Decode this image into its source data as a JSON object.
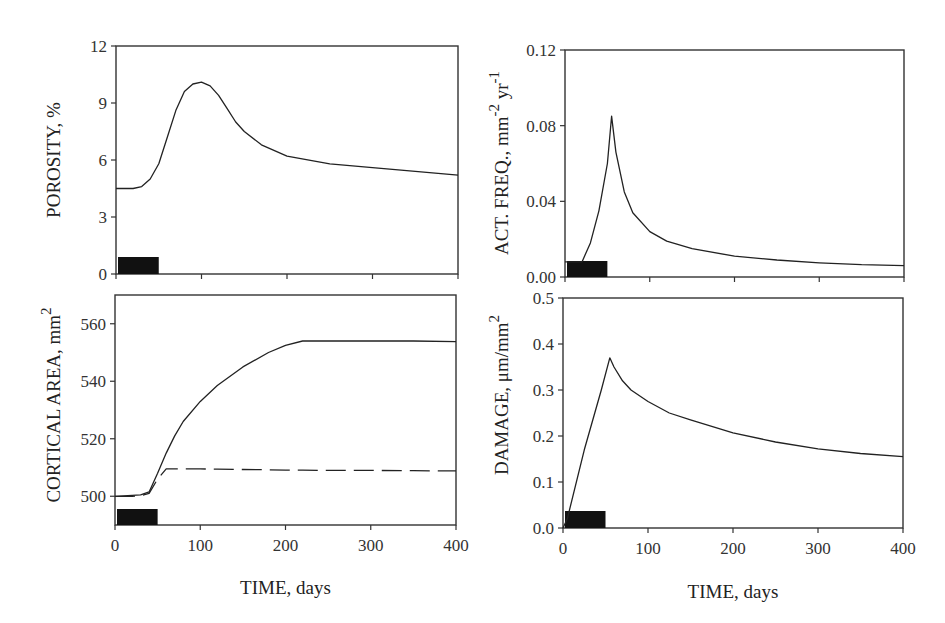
{
  "chart_data": [
    {
      "id": "porosity",
      "type": "line",
      "ylabel": "POROSITY, %",
      "xlabel": "",
      "xlim": [
        0,
        400
      ],
      "ylim": [
        0,
        12
      ],
      "yticks": [
        "0",
        "3",
        "6",
        "9",
        "12"
      ],
      "xticks": [
        0,
        100,
        200,
        300,
        400
      ],
      "x": [
        0,
        10,
        20,
        30,
        40,
        50,
        60,
        70,
        80,
        90,
        100,
        110,
        120,
        130,
        140,
        150,
        170,
        200,
        250,
        300,
        350,
        400
      ],
      "series": [
        {
          "name": "porosity",
          "style": "solid",
          "values": [
            4.5,
            4.5,
            4.5,
            4.6,
            5.0,
            5.8,
            7.2,
            8.6,
            9.6,
            10.0,
            10.1,
            9.9,
            9.4,
            8.7,
            8.0,
            7.5,
            6.8,
            6.2,
            5.8,
            5.6,
            5.4,
            5.2
          ]
        }
      ],
      "loading_bar": {
        "x_start": 0,
        "x_end": 50,
        "label": "loading period"
      },
      "grid": false
    },
    {
      "id": "activation_frequency",
      "type": "line",
      "ylabel": "ACT. FREQ., mm",
      "ylabel_sup1": "-2",
      "ylabel_mid": " yr",
      "ylabel_sup2": "-1",
      "xlabel": "",
      "xlim": [
        0,
        400
      ],
      "ylim": [
        0,
        0.12
      ],
      "yticks": [
        "0.00",
        "0.04",
        "0.08",
        "0.12"
      ],
      "xticks": [
        0,
        100,
        200,
        300,
        400
      ],
      "x": [
        0,
        20,
        30,
        40,
        50,
        55,
        60,
        70,
        80,
        100,
        120,
        150,
        200,
        250,
        300,
        350,
        400
      ],
      "series": [
        {
          "name": "activation frequency",
          "style": "solid",
          "values": [
            0.008,
            0.008,
            0.018,
            0.035,
            0.06,
            0.085,
            0.066,
            0.045,
            0.034,
            0.024,
            0.019,
            0.015,
            0.011,
            0.009,
            0.0075,
            0.0065,
            0.006
          ]
        }
      ],
      "loading_bar": {
        "x_start": 0,
        "x_end": 50,
        "label": "loading period"
      },
      "grid": false
    },
    {
      "id": "cortical_area",
      "type": "line",
      "ylabel": "CORTICAL  AREA, mm",
      "ylabel_sup": "2",
      "xlabel": "TIME, days",
      "xlim": [
        0,
        400
      ],
      "ylim": [
        490,
        570
      ],
      "yticks": [
        "500",
        "520",
        "540",
        "560"
      ],
      "xticks": [
        "0",
        "100",
        "200",
        "300",
        "400"
      ],
      "x": [
        0,
        20,
        30,
        40,
        50,
        60,
        70,
        80,
        100,
        120,
        150,
        180,
        200,
        220,
        250,
        300,
        350,
        400
      ],
      "series": [
        {
          "name": "solid",
          "style": "solid",
          "values": [
            500,
            500.3,
            500.5,
            501.5,
            508,
            515,
            521,
            526,
            533,
            538.5,
            545,
            550,
            552.5,
            554,
            554,
            554,
            554,
            553.8
          ]
        },
        {
          "name": "dashed",
          "style": "dashed",
          "values": [
            500,
            500,
            500.2,
            501,
            506,
            509.5,
            509.5,
            509.5,
            509.5,
            509.4,
            509.3,
            509.2,
            509.1,
            509.1,
            509,
            509,
            508.9,
            508.8
          ]
        }
      ],
      "loading_bar": {
        "x_start": 0,
        "x_end": 50,
        "label": "loading period"
      },
      "grid": false
    },
    {
      "id": "damage",
      "type": "line",
      "ylabel": "DAMAGE, μm/mm",
      "ylabel_sup": "2",
      "xlabel": "TIME, days",
      "xlim": [
        0,
        400
      ],
      "ylim": [
        0,
        0.5
      ],
      "yticks": [
        "0.0",
        "0.1",
        "0.2",
        "0.3",
        "0.4",
        "0.5"
      ],
      "xticks": [
        "0",
        "100",
        "200",
        "300",
        "400"
      ],
      "x": [
        0,
        5,
        25,
        45,
        55,
        60,
        70,
        80,
        100,
        125,
        150,
        200,
        250,
        300,
        350,
        400
      ],
      "series": [
        {
          "name": "damage",
          "style": "solid",
          "values": [
            0.0,
            0.02,
            0.17,
            0.3,
            0.37,
            0.35,
            0.32,
            0.3,
            0.275,
            0.25,
            0.235,
            0.207,
            0.187,
            0.172,
            0.162,
            0.155
          ]
        }
      ],
      "loading_bar": {
        "x_start": 0,
        "x_end": 50,
        "label": "loading period"
      },
      "grid": false
    }
  ]
}
